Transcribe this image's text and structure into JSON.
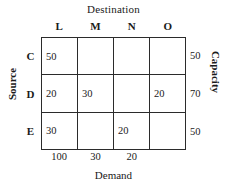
{
  "chart_data": {
    "type": "table",
    "title": "Destination",
    "xlabel": "Demand",
    "ylabel": "Source",
    "right_label": "Capacity",
    "top_label": "Destination",
    "columns": [
      "L",
      "M",
      "N",
      "O"
    ],
    "rows": [
      "C",
      "D",
      "E"
    ],
    "values": [
      [
        "50",
        "",
        "",
        ""
      ],
      [
        "20",
        "30",
        "",
        "20"
      ],
      [
        "30",
        "",
        "20",
        ""
      ]
    ],
    "capacities": [
      "50",
      "70",
      "50"
    ],
    "demands": [
      "100",
      "30",
      "20",
      ""
    ],
    "grid": true,
    "border_color": "#2b2b2b",
    "text_color": "#1a1a1a",
    "background": "#ffffff"
  },
  "labels": {
    "destination": "Destination",
    "source": "Source",
    "capacity": "Capacity",
    "demand": "Demand"
  }
}
